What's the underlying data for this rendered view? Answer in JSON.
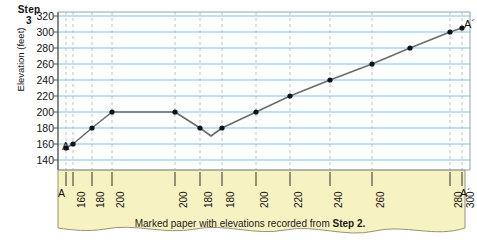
{
  "step": {
    "word": "Step",
    "number": "3"
  },
  "axes": {
    "y_title": "Elevation (feet)",
    "y_ticks": [
      320,
      300,
      280,
      260,
      240,
      220,
      200,
      180,
      160,
      140
    ],
    "y_min": 140,
    "y_max": 320
  },
  "endpoints": {
    "start": "A",
    "end": "A´"
  },
  "paper": {
    "caption_text": "Marked paper with elevations recorded from ",
    "caption_bold": "Step 2.",
    "color": "#f7f2c2",
    "edge_color": "#9a9272"
  },
  "colors": {
    "gridline": "#7dc4e8",
    "axis": "#555555",
    "profile_line": "#6b6b6b",
    "point": "#111111",
    "dashed_guide": "#b9b9b9"
  },
  "chart_data": {
    "type": "line",
    "title": "",
    "xlabel": "",
    "ylabel": "Elevation (feet)",
    "ylim": [
      140,
      320
    ],
    "grid": true,
    "legend": "none",
    "x_tick_labels": [
      "A",
      "160",
      "180",
      "200",
      "200",
      "180",
      "180",
      "200",
      "220",
      "240",
      "260",
      "280",
      "300",
      "A´"
    ],
    "x_tick_px": [
      66,
      73,
      92,
      112,
      175,
      200,
      222,
      256,
      290,
      330,
      372,
      450,
      462
    ],
    "points": [
      {
        "label": "A",
        "elevation": 155,
        "x_px": 66
      },
      {
        "label": "160",
        "elevation": 160,
        "x_px": 73
      },
      {
        "label": "180",
        "elevation": 180,
        "x_px": 92
      },
      {
        "label": "200",
        "elevation": 200,
        "x_px": 112
      },
      {
        "label": "200",
        "elevation": 200,
        "x_px": 175
      },
      {
        "label": "180",
        "elevation": 180,
        "x_px": 200
      },
      {
        "label": "180",
        "elevation": 180,
        "x_px": 222
      },
      {
        "label": "200",
        "elevation": 200,
        "x_px": 256
      },
      {
        "label": "220",
        "elevation": 220,
        "x_px": 290
      },
      {
        "label": "240",
        "elevation": 240,
        "x_px": 330
      },
      {
        "label": "260",
        "elevation": 260,
        "x_px": 372
      },
      {
        "label": "280",
        "elevation": 280,
        "x_px": 410
      },
      {
        "label": "300",
        "elevation": 300,
        "x_px": 450
      },
      {
        "label": "A´",
        "elevation": 305,
        "x_px": 462
      }
    ],
    "valley_bottom": {
      "elevation": 170,
      "x_px": 211
    }
  }
}
